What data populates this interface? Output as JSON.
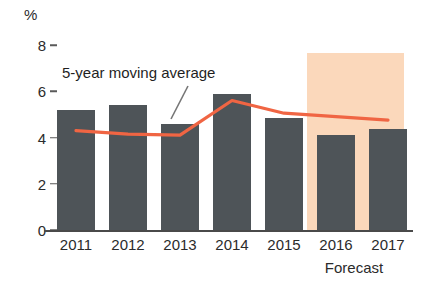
{
  "chart_data": {
    "type": "bar",
    "title": "",
    "subtitle": "",
    "xlabel": "",
    "ylabel": "%",
    "unit_label": "%",
    "categories": [
      "2011",
      "2012",
      "2013",
      "2014",
      "2015",
      "2016",
      "2017"
    ],
    "ylim": [
      0,
      8
    ],
    "yticks": [
      0,
      2,
      4,
      6,
      8
    ],
    "ytick_labels": [
      "0",
      "2",
      "4",
      "6",
      "8"
    ],
    "grid": false,
    "legend": "none",
    "series": [
      {
        "name": "Annual value",
        "type": "bar",
        "color": "#4e5458",
        "values": [
          5.2,
          5.4,
          4.6,
          5.9,
          4.85,
          4.1,
          4.35
        ]
      },
      {
        "name": "5-year moving average",
        "type": "line",
        "color": "#f06543",
        "values": [
          4.3,
          4.15,
          4.1,
          5.6,
          5.05,
          4.9,
          4.75
        ]
      }
    ],
    "annotations": [
      {
        "text": "5-year moving average",
        "kind": "series-label",
        "has_leader_line": true
      },
      {
        "text": "Forecast",
        "kind": "region-label",
        "applies_to": [
          "2016",
          "2017"
        ]
      }
    ],
    "shaded_regions": [
      {
        "label": "Forecast",
        "color": "#fbd8bb",
        "from": "2015.5",
        "to": "2017.5",
        "y_top": 7.65
      }
    ]
  },
  "colors": {
    "bar": "#4e5458",
    "line": "#f06543",
    "forecast_band": "#fbd8bb",
    "axis": "#4a4a4a",
    "text": "#2b2b2b",
    "background": "#ffffff"
  }
}
